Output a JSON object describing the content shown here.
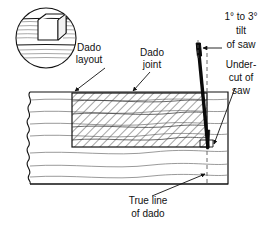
{
  "figure": {
    "background_color": "#ffffff",
    "line_color": "#111111",
    "hatch_color": "#555555",
    "blade_color": "#000000",
    "width": 269,
    "height": 225
  },
  "labels": {
    "dado_layout_line1": "Dado",
    "dado_layout_line2": "layout",
    "dado_joint_line1": "Dado",
    "dado_joint_line2": "joint",
    "tilt_line1": "1° to 3°",
    "tilt_line2": "tilt",
    "tilt_line3": "of saw",
    "undercut_line1": "Under-",
    "undercut_line2": "cut of",
    "undercut_line3": "saw",
    "true_line_line1": "True line",
    "true_line_line2": "of dado"
  },
  "annotations": {
    "tilt_degrees_min": "1°",
    "tilt_degrees_max": "3°"
  },
  "parts": {
    "detail_circle": "dado-groove-detail-inset",
    "workpiece": "wood-board-section",
    "dado_region": "hatched-dado-cut-region",
    "saw_blade": "tilted-saw-blade",
    "centerline": "vertical-dashed-reference-line"
  }
}
